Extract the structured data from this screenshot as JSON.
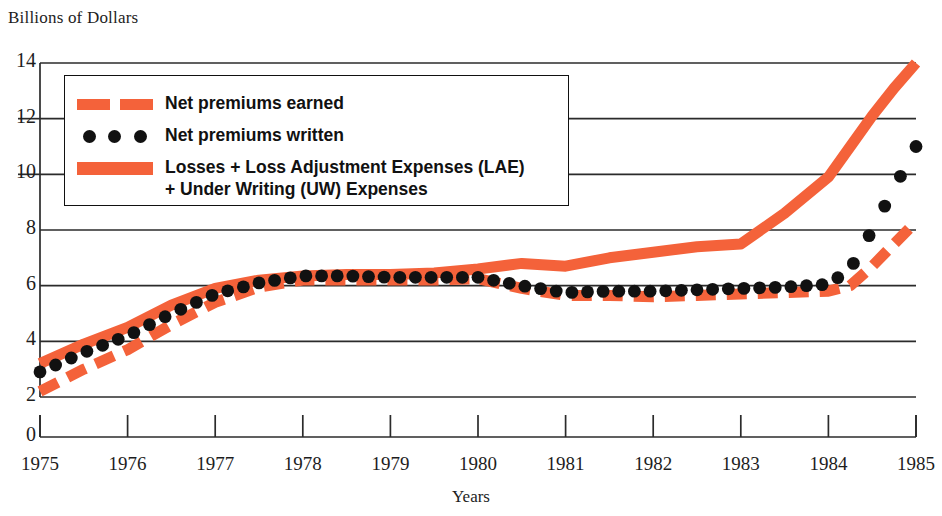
{
  "chart_data": {
    "type": "line",
    "title": "",
    "ylabel": "Billions of Dollars",
    "xlabel": "Years",
    "ylim": [
      0,
      14
    ],
    "xlim": [
      1975,
      1985
    ],
    "yticks": [
      0,
      2,
      4,
      6,
      8,
      10,
      12,
      14
    ],
    "xticks": [
      1975,
      1976,
      1977,
      1978,
      1979,
      1980,
      1981,
      1982,
      1983,
      1984,
      1985
    ],
    "grid": "horizontal",
    "axis_break": "y-axis broken between 0 and 2",
    "legend_position": "upper-left inside plot",
    "x": [
      1975,
      1975.5,
      1976,
      1976.5,
      1977,
      1977.5,
      1978,
      1978.5,
      1979,
      1979.5,
      1980,
      1980.5,
      1981,
      1981.5,
      1982,
      1982.5,
      1983,
      1983.5,
      1984,
      1984.25,
      1984.5,
      1984.75,
      1985
    ],
    "series": [
      {
        "name": "Losses + Loss Adjustment Expenses (LAE) + Under Writing (UW) Expenses",
        "style": "solid",
        "color": "#F4623A",
        "values": [
          3.2,
          3.9,
          4.5,
          5.3,
          5.9,
          6.2,
          6.35,
          6.4,
          6.4,
          6.45,
          6.6,
          6.8,
          6.7,
          7.0,
          7.2,
          7.4,
          7.5,
          8.6,
          9.9,
          11.0,
          12.1,
          13.1,
          14.0
        ]
      },
      {
        "name": "Net premiums written",
        "style": "dotted",
        "color": "#111111",
        "values": [
          2.9,
          3.6,
          4.2,
          5.0,
          5.7,
          6.1,
          6.35,
          6.35,
          6.3,
          6.3,
          6.3,
          6.0,
          5.75,
          5.8,
          5.8,
          5.85,
          5.9,
          5.95,
          6.05,
          6.6,
          8.0,
          9.5,
          11.0
        ]
      },
      {
        "name": "Net premiums earned",
        "style": "dashed",
        "color": "#F4623A",
        "values": [
          2.2,
          3.0,
          3.7,
          4.6,
          5.4,
          5.95,
          6.2,
          6.2,
          6.2,
          6.2,
          6.25,
          5.9,
          5.65,
          5.65,
          5.6,
          5.65,
          5.7,
          5.75,
          5.8,
          6.0,
          6.7,
          7.5,
          8.3
        ]
      }
    ]
  },
  "legend": {
    "entries": [
      {
        "label": "Net premiums earned",
        "swatch": "dashed-coral"
      },
      {
        "label": "Net premiums written",
        "swatch": "black-dots"
      },
      {
        "label": "Losses + Loss Adjustment Expenses (LAE)\n+ Under Writing (UW) Expenses",
        "swatch": "solid-coral"
      }
    ]
  },
  "colors": {
    "series_coral": "#F4623A",
    "series_black": "#111111",
    "grid": "#2b2b2b",
    "background": "#FFFFFF"
  }
}
